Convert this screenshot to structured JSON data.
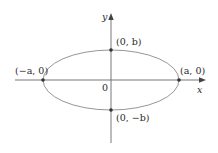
{
  "diagram": {
    "type": "ellipse-on-axes",
    "colors": {
      "ellipse": "#8a8a8a",
      "axes": "#6a6a6a",
      "points": "#333333",
      "text": "#2a2a2a"
    },
    "axes": {
      "x_label": "x",
      "y_label": "y",
      "origin_label": "0"
    },
    "points": [
      {
        "id": "top",
        "label": "(0, b)"
      },
      {
        "id": "bottom",
        "label": "(0, −b)"
      },
      {
        "id": "left",
        "label": "(−a, 0)"
      },
      {
        "id": "right",
        "label": "(a, 0)"
      }
    ]
  }
}
